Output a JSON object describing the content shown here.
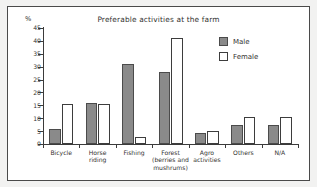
{
  "figure": {
    "unit_label": "%",
    "legend_position": "top-right inside plot"
  },
  "legend": {
    "male_label": "Male",
    "female_label": "Female"
  },
  "colors": {
    "male_fill": "#8a8a8a",
    "male_stroke": "#4b4b4b",
    "female_fill": "#ffffff",
    "female_stroke": "#3d3d3d",
    "axis": "#3b3b3b",
    "frame": "#4a4a4a",
    "text": "#33322f",
    "page_background": "#f2f2f1"
  },
  "chart_data": {
    "type": "bar",
    "title": "Preferable activities at the farm",
    "xlabel": "",
    "ylabel": "%",
    "ylim": [
      0,
      45
    ],
    "yticks": [
      0,
      5,
      10,
      15,
      20,
      25,
      30,
      35,
      40,
      45
    ],
    "ytick_labels": [
      "0",
      "5",
      "10",
      "15",
      "20",
      "25",
      "30",
      "35",
      "40",
      "45"
    ],
    "grid": false,
    "legend": [
      "Male",
      "Female"
    ],
    "legend_position": "upper right",
    "categories": [
      "Bicycle",
      "Horse riding",
      "Fishing",
      "Forest (berries and mushrums)",
      "Agro activities",
      "Others",
      "N/A"
    ],
    "category_lines": [
      [
        "Bicycle"
      ],
      [
        "Horse",
        "riding"
      ],
      [
        "Fishing"
      ],
      [
        "Forest",
        "(berries and",
        "mushrums)"
      ],
      [
        "Agro",
        "activities"
      ],
      [
        "Others"
      ],
      [
        "N/A"
      ]
    ],
    "series": [
      {
        "name": "Male",
        "values": [
          6.0,
          16.1,
          31.0,
          28.0,
          4.4,
          7.4,
          7.4
        ]
      },
      {
        "name": "Female",
        "values": [
          15.4,
          15.4,
          2.7,
          41.2,
          5.2,
          10.3,
          10.3
        ]
      }
    ]
  }
}
